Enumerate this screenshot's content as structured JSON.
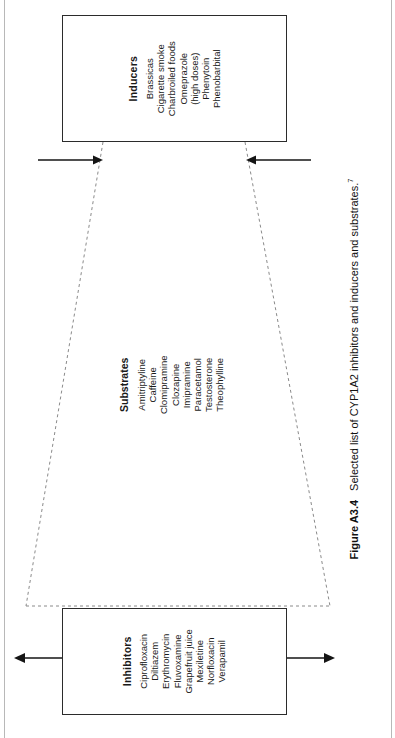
{
  "figure": {
    "caption_label": "Figure A3.4",
    "caption_text": "Selected list of CYP1A2 inhibitors and inducers and substrates.",
    "caption_reference": "7"
  },
  "inducers": {
    "title": "Inducers",
    "items": [
      "Brassicas",
      "Cigarette smoke",
      "Charbroiled foods",
      "Omeprazole",
      "(high doses)",
      "Phenytoin",
      "Phenobarbital"
    ]
  },
  "substrates": {
    "title": "Substrates",
    "items": [
      "Amitriptyline",
      "Caffeine",
      "Clomipramine",
      "Clozapine",
      "Imipramine",
      "Paracetamol",
      "Testosterone",
      "Theophylline"
    ]
  },
  "inhibitors": {
    "title": "Inhibitors",
    "items": [
      "Ciprofloxacin",
      "Diltiazem",
      "Erythromycin",
      "Fluvoxamine",
      "Grapefruit juice",
      "Mexiletine",
      "Norfloxacin",
      "Verapamil"
    ]
  },
  "arrows": {
    "inducer_left": "arrow-inward-left",
    "inducer_right": "arrow-inward-right",
    "inhibitor_left": "arrow-outward-left",
    "inhibitor_right": "arrow-outward-right"
  },
  "colors": {
    "ink": "#2b2b2b",
    "dashed": "#8a8a8a",
    "page_rule": "#b8b8b8"
  }
}
